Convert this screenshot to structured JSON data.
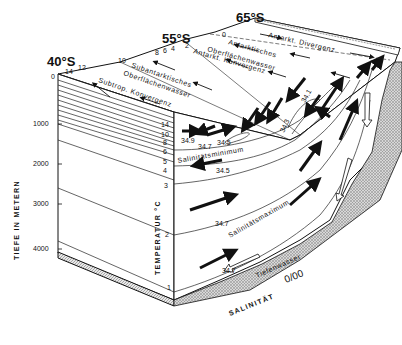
{
  "diagram": {
    "type": "oceanographic block diagram",
    "latitudes": {
      "north": "40°S",
      "mid": "55°S",
      "south": "65°S"
    },
    "surface_temperature_ticks": [
      "0",
      "14",
      "12",
      "10",
      "8",
      "6",
      "4",
      "2",
      "0"
    ],
    "surface_labels": {
      "subtrop_konvergenz": "Subtrop. Konvergenz",
      "subant_1": "Subantarktisches",
      "subant_2": "Oberflächenwasser",
      "ant_konvergenz": "Antarkt. Konvergenz",
      "ant_1": "Antarktisches",
      "ant_2": "Oberflächenwasser",
      "ant_divergenz": "Antarkt. Divergenz"
    },
    "depth_axis": {
      "label": "TIEFE IN METERN",
      "ticks": [
        "1000",
        "2000",
        "3000",
        "4000"
      ]
    },
    "temperature_axis": {
      "label": "TEMPERATUR °C",
      "ticks": [
        "14",
        "10",
        "8",
        "6",
        "5",
        "4",
        "3",
        "2",
        "1"
      ]
    },
    "salinity_labels": {
      "s349": "34.9",
      "s347a": "34.7",
      "s345a": "34.5",
      "s345b": "34.5",
      "s343": "34.3",
      "s341": "34.1",
      "s347b": "34.7",
      "s347c": "34.7"
    },
    "water_masses": {
      "sal_min": "Salinitätsminimum",
      "sal_max": "Salinitätsmaximum",
      "tiefenwasser": "Tiefenwasser"
    },
    "salinity_axis": {
      "label": "SALINITÄT",
      "unit": "0/00"
    }
  }
}
